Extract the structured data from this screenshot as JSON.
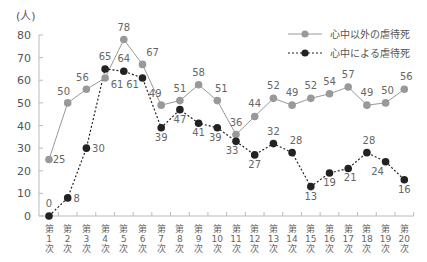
{
  "chart_data": {
    "type": "line",
    "title": "",
    "xlabel": "",
    "ylabel": "(人)",
    "ylim": [
      0,
      80
    ],
    "yticks": [
      0,
      10,
      20,
      30,
      40,
      50,
      60,
      70,
      80
    ],
    "grid": false,
    "legend_position": "top-right",
    "categories": [
      "第1次",
      "第2次",
      "第3次",
      "第4次",
      "第5次",
      "第6次",
      "第7次",
      "第8次",
      "第9次",
      "第10次",
      "第11次",
      "第12次",
      "第13次",
      "第14次",
      "第15次",
      "第16次",
      "第17次",
      "第18次",
      "第19次",
      "第20次"
    ],
    "x_tick_lines": [
      [
        "第",
        "1",
        "次"
      ],
      [
        "第",
        "2",
        "次"
      ],
      [
        "第",
        "3",
        "次"
      ],
      [
        "第",
        "4",
        "次"
      ],
      [
        "第",
        "5",
        "次"
      ],
      [
        "第",
        "6",
        "次"
      ],
      [
        "第",
        "7",
        "次"
      ],
      [
        "第",
        "8",
        "次"
      ],
      [
        "第",
        "9",
        "次"
      ],
      [
        "第",
        "10",
        "次"
      ],
      [
        "第",
        "11",
        "次"
      ],
      [
        "第",
        "12",
        "次"
      ],
      [
        "第",
        "13",
        "次"
      ],
      [
        "第",
        "14",
        "次"
      ],
      [
        "第",
        "15",
        "次"
      ],
      [
        "第",
        "16",
        "次"
      ],
      [
        "第",
        "17",
        "次"
      ],
      [
        "第",
        "18",
        "次"
      ],
      [
        "第",
        "19",
        "次"
      ],
      [
        "第",
        "20",
        "次"
      ]
    ],
    "series": [
      {
        "name": "心中以外の虐待死",
        "style": "solid",
        "color": "#999999",
        "values": [
          25,
          50,
          56,
          61,
          78,
          67,
          49,
          51,
          58,
          51,
          36,
          44,
          52,
          49,
          52,
          54,
          57,
          49,
          50,
          56
        ],
        "label_offsets": [
          [
            10,
            4
          ],
          [
            -4,
            -8
          ],
          [
            -4,
            -8
          ],
          [
            12,
            10
          ],
          [
            0,
            -9
          ],
          [
            10,
            -8
          ],
          [
            -6,
            -8
          ],
          [
            0,
            -9
          ],
          [
            0,
            -9
          ],
          [
            4,
            -9
          ],
          [
            0,
            -9
          ],
          [
            0,
            -9
          ],
          [
            0,
            -9
          ],
          [
            0,
            -9
          ],
          [
            0,
            -9
          ],
          [
            0,
            -9
          ],
          [
            0,
            -9
          ],
          [
            0,
            -9
          ],
          [
            2,
            -9
          ],
          [
            2,
            -9
          ]
        ]
      },
      {
        "name": "心中による虐待死",
        "style": "dashed",
        "color": "#222222",
        "values": [
          0,
          8,
          30,
          65,
          64,
          61,
          39,
          47,
          41,
          39,
          33,
          27,
          32,
          28,
          13,
          19,
          21,
          28,
          24,
          16
        ],
        "label_offsets": [
          [
            0,
            -9
          ],
          [
            9,
            4
          ],
          [
            12,
            4
          ],
          [
            0,
            -9
          ],
          [
            0,
            -9
          ],
          [
            -10,
            10
          ],
          [
            0,
            13
          ],
          [
            0,
            13
          ],
          [
            0,
            13
          ],
          [
            -2,
            13
          ],
          [
            -4,
            13
          ],
          [
            0,
            13
          ],
          [
            0,
            -9
          ],
          [
            4,
            -9
          ],
          [
            0,
            13
          ],
          [
            0,
            13
          ],
          [
            2,
            13
          ],
          [
            2,
            -9
          ],
          [
            -8,
            13
          ],
          [
            0,
            13
          ]
        ]
      }
    ]
  }
}
